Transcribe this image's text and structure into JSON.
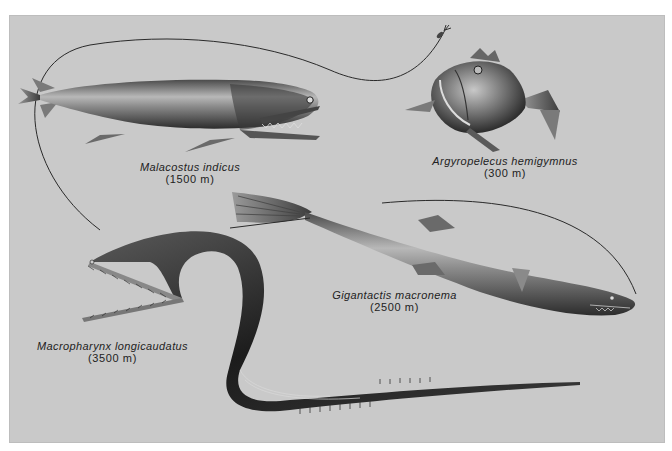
{
  "plate": {
    "background_color": "#c9c9c9",
    "border_color": "#ffffff"
  },
  "species": [
    {
      "name": "Malacostus indicus",
      "depth": "(1500 m)"
    },
    {
      "name": "Argyropelecus hemigymnus",
      "depth": "(300 m)"
    },
    {
      "name": "Gigantactis macronema",
      "depth": "(2500 m)"
    },
    {
      "name": "Macropharynx longicaudatus",
      "depth": "(3500 m)"
    }
  ]
}
